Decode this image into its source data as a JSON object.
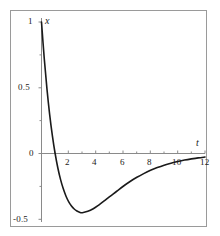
{
  "figure": {
    "background": "#ffffff",
    "frame_color": "#9a9a9a",
    "curve_color": "#1a1a1a",
    "axis_color": "#808080"
  },
  "axis_names": {
    "y": "x",
    "x": "t"
  },
  "chart_data": {
    "type": "line",
    "title": "",
    "xlabel": "t",
    "ylabel": "x",
    "xlim": [
      0,
      12
    ],
    "ylim": [
      -0.6,
      1.05
    ],
    "grid": false,
    "legend": "none",
    "xticks": [
      2,
      4,
      6,
      8,
      10,
      12
    ],
    "xticklabels": [
      "2",
      "4",
      "6",
      "8",
      "10",
      "12"
    ],
    "yticks": [
      1,
      0.5,
      0,
      -0.5
    ],
    "yticklabels": [
      "1",
      "0.5",
      "0",
      "-0.5"
    ],
    "annotations": [
      "curve starts at (0, 1)",
      "zero crossing near t = 1",
      "minimum about x = -0.5 near t = 2",
      "tail rises toward 0 as t increases"
    ],
    "series": [
      {
        "name": "x(t)",
        "x": [
          0.0,
          0.2,
          0.4,
          0.6,
          0.8,
          1.0,
          1.2,
          1.4,
          1.6,
          1.8,
          2.0,
          2.2,
          2.4,
          2.6,
          2.8,
          3.0,
          3.4,
          3.8,
          4.2,
          4.6,
          5.0,
          5.5,
          6.0,
          6.5,
          7.0,
          7.5,
          8.0,
          8.5,
          9.0,
          9.5,
          10.0,
          10.5,
          11.0,
          11.5,
          12.0
        ],
        "y": [
          1.0,
          0.724,
          0.491,
          0.296,
          0.134,
          0.0,
          -0.11,
          -0.199,
          -0.269,
          -0.325,
          -0.368,
          -0.399,
          -0.422,
          -0.437,
          -0.447,
          -0.45,
          -0.44,
          -0.42,
          -0.392,
          -0.361,
          -0.328,
          -0.289,
          -0.249,
          -0.213,
          -0.181,
          -0.153,
          -0.128,
          -0.107,
          -0.089,
          -0.074,
          -0.061,
          -0.05,
          -0.041,
          -0.033,
          -0.027
        ]
      }
    ]
  },
  "tick_labels": {
    "y_1": "1",
    "y_05": "0.5",
    "y_0": "0",
    "y_m05": "-0.5",
    "x_2": "2",
    "x_4": "4",
    "x_6": "6",
    "x_8": "8",
    "x_10": "10",
    "x_12": "12"
  }
}
